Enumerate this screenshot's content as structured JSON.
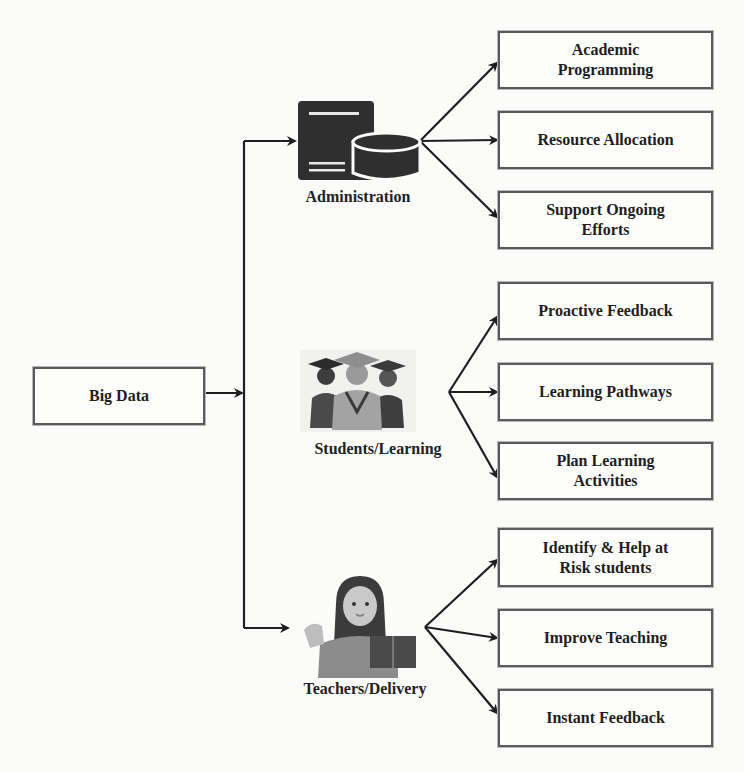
{
  "diagram": {
    "source": {
      "label": "Big Data"
    },
    "branches": [
      {
        "label": "Administration",
        "icon": "server-database-icon",
        "outputs": [
          "Academic Programming",
          "Resource Allocation",
          "Support Ongoing Efforts"
        ]
      },
      {
        "label": "Students/Learning",
        "icon": "graduates-icon",
        "outputs": [
          "Proactive Feedback",
          "Learning Pathways",
          "Plan Learning Activities"
        ]
      },
      {
        "label": "Teachers/Delivery",
        "icon": "teacher-icon",
        "outputs": [
          "Identify & Help at Risk students",
          "Improve Teaching",
          "Instant Feedback"
        ]
      }
    ]
  },
  "colors": {
    "line": "#1e1e1e",
    "box_border": "#5a5a5a",
    "icon_dark": "#2f2f2f",
    "icon_mid": "#8a8a8a"
  }
}
